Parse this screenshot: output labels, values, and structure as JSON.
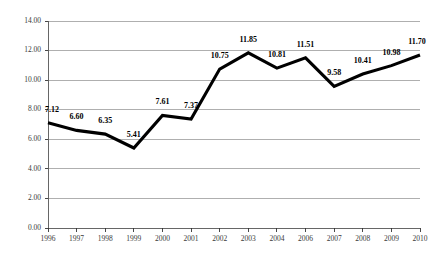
{
  "chart_data": {
    "type": "line",
    "title": "",
    "subtitle": "",
    "xlabel": "",
    "ylabel": "",
    "categories": [
      "1996",
      "1997",
      "1998",
      "1999",
      "2000",
      "2001",
      "2002",
      "2003",
      "2004",
      "2006",
      "2007",
      "2008",
      "2009",
      "2010"
    ],
    "values": [
      7.12,
      6.6,
      6.35,
      5.41,
      7.61,
      7.37,
      10.75,
      11.85,
      10.81,
      11.51,
      9.58,
      10.41,
      10.98,
      11.7
    ],
    "point_labels": [
      "7.12",
      "6.60",
      "6.35",
      "5.41",
      "7.61",
      "7.37",
      "10.75",
      "11.85",
      "10.81",
      "11.51",
      "9.58",
      "10.41",
      "10.98",
      "11.70"
    ],
    "series": [
      {
        "name": "",
        "values": [
          7.12,
          6.6,
          6.35,
          5.41,
          7.61,
          7.37,
          10.75,
          11.85,
          10.81,
          11.51,
          9.58,
          10.41,
          10.98,
          11.7
        ]
      }
    ],
    "ylim": [
      0.0,
      14.0
    ],
    "ytick_values": [
      0.0,
      2.0,
      4.0,
      6.0,
      8.0,
      10.0,
      12.0,
      14.0
    ],
    "ytick_labels": [
      "0.00",
      "2.00",
      "4.00",
      "6.00",
      "8.00",
      "10.00",
      "12.00",
      "14.00"
    ],
    "xtick_labels": [
      "1996",
      "1997",
      "1998",
      "1999",
      "2000",
      "2001",
      "2002",
      "2003",
      "2004",
      "2006",
      "2007",
      "2008",
      "2009",
      "2010"
    ],
    "grid": true,
    "grid_axis": "y",
    "legend": false,
    "legend_position": "none",
    "annotations": [],
    "colors": {
      "line": "#000000",
      "gridline": "#9b9b9b",
      "axis": "#555555",
      "background": "#ffffff",
      "label_text": "#000000",
      "tick_text": "#3a3a3a"
    }
  },
  "layout": {
    "plot_left": 48,
    "plot_right": 420,
    "plot_top": 21,
    "plot_bottom": 228,
    "label_offset_y": 11
  }
}
